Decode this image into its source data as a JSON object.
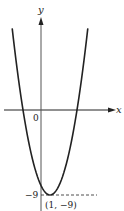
{
  "chart_data": {
    "type": "line",
    "title": "",
    "function": "y = (x - 1)^2 - 9",
    "xlabel": "x",
    "ylabel": "y",
    "origin_label": "0",
    "x": [
      -2.5,
      -2,
      -1,
      0,
      1,
      2,
      3,
      4,
      4.5
    ],
    "y": [
      3.25,
      0,
      -5,
      -8,
      -9,
      -8,
      -5,
      0,
      3.25
    ],
    "annotations": [
      {
        "label": "-9",
        "x": 0,
        "y": -9,
        "position": "y-axis tick"
      },
      {
        "label": "(1, −9)",
        "x": 1,
        "y": -9,
        "position": "vertex"
      }
    ],
    "grid": false,
    "legend": null
  },
  "labels": {
    "y_axis": "y",
    "x_axis": "x",
    "origin": "0",
    "y_tick": "−9",
    "vertex": "(1, −9)"
  }
}
